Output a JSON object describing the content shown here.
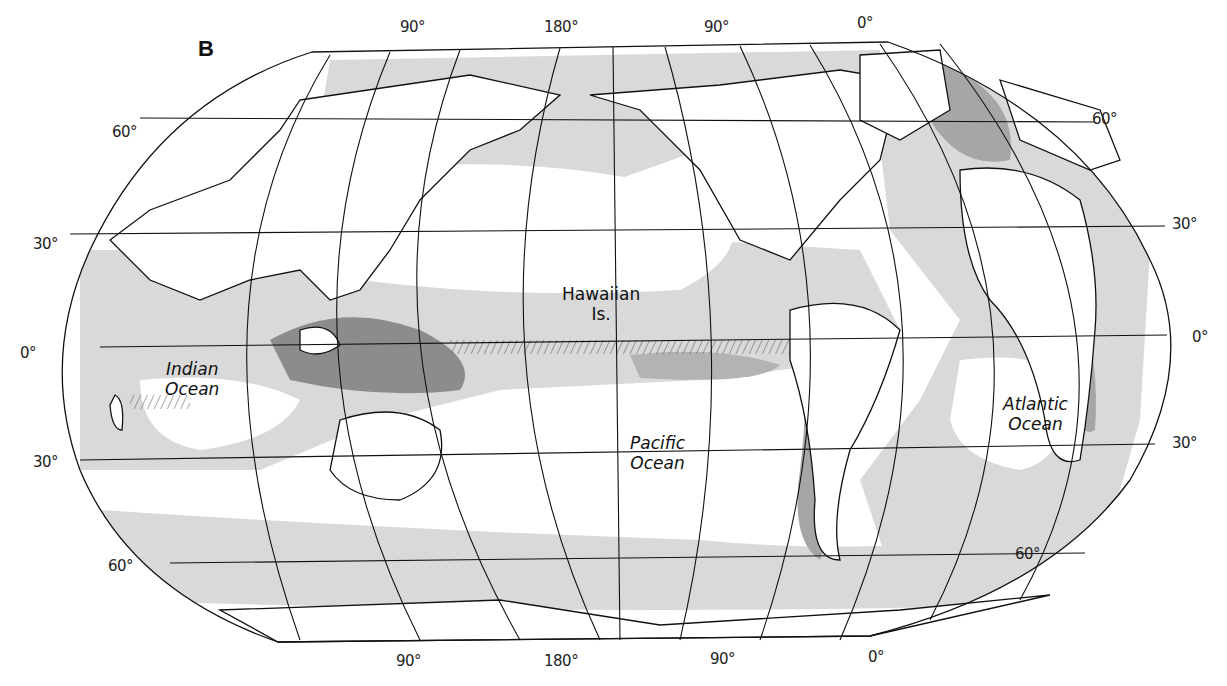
{
  "figure": {
    "panel_letter": "B",
    "colors": {
      "background": "#ffffff",
      "land": "#ffffff",
      "outline": "#111111",
      "shade_light": "#d9d9d9",
      "shade_medium": "#b3b3b3",
      "shade_dark": "#8c8c8c"
    }
  },
  "longitude_labels_top": [
    "90°",
    "180°",
    "90°",
    "0°"
  ],
  "longitude_labels_bottom": [
    "90°",
    "180°",
    "90°",
    "0°"
  ],
  "latitude_labels_left": [
    "60°",
    "30°",
    "0°",
    "30°",
    "60°"
  ],
  "latitude_labels_right": [
    "60°",
    "30°",
    "0°",
    "30°",
    "60°"
  ],
  "ocean_labels": {
    "indian": [
      "Indian",
      "Ocean"
    ],
    "pacific": [
      "Pacific",
      "Ocean"
    ],
    "atlantic": [
      "Atlantic",
      "Ocean"
    ],
    "hawaii": [
      "Hawaiian",
      "Is."
    ]
  }
}
